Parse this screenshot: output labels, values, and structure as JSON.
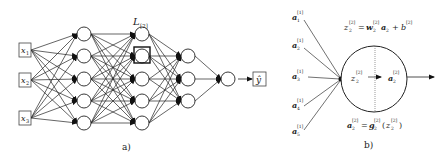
{
  "panel_a": {
    "caption": "a)",
    "inputs": [
      "x",
      "x",
      "x"
    ],
    "input_subs": [
      "1",
      "2",
      "3"
    ],
    "layer_label": "L",
    "layer_label_sub": "[2]",
    "output_label": "ŷ",
    "layer_sizes": [
      3,
      5,
      5,
      3,
      1
    ],
    "highlighted_node": {
      "layer": 2,
      "index": 1
    }
  },
  "panel_b": {
    "caption": "b)",
    "inputs": [
      {
        "base": "a",
        "sup": "[1]",
        "sub": "1"
      },
      {
        "base": "a",
        "sup": "[1]",
        "sub": "2"
      },
      {
        "base": "a",
        "sup": "[1]",
        "sub": "3"
      },
      {
        "base": "a",
        "sup": "[1]",
        "sub": "4"
      },
      {
        "base": "a",
        "sup": "[1]",
        "sub": "5"
      }
    ],
    "eq_top": {
      "z": "z",
      "z_sup": "[2]",
      "z_sub": "2",
      "eq": "=",
      "w": "w",
      "w_sup": "[2]",
      "w_sub": "2",
      "a": "a",
      "a_sub": "2",
      "plus": "+",
      "b": "b",
      "b_sup": "[2]"
    },
    "eq_bottom": {
      "a": "a",
      "a_sup": "[2]",
      "a_sub": "2",
      "eq": "=",
      "g": "g",
      "g_sup": "[2]",
      "g_sub": "2",
      "open": "(",
      "z": "z",
      "z_sup": "[2]",
      "z_sub": "2",
      "close": ")"
    },
    "node_left": {
      "base": "z",
      "sup": "[2]",
      "sub": "2"
    },
    "node_right": {
      "base": "a",
      "sup": "[2]",
      "sub": "2"
    }
  }
}
